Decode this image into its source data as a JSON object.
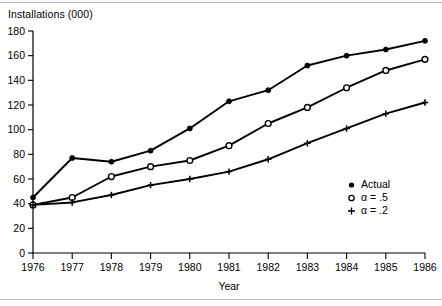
{
  "figure": {
    "y_axis_title": "Installations (000)",
    "x_axis_title": "Year"
  },
  "legend": {
    "position": "right-inside",
    "entries": [
      {
        "marker": "filled-circle-icon",
        "label": "Actual"
      },
      {
        "marker": "open-circle-icon",
        "label": "α = .5"
      },
      {
        "marker": "plus-icon",
        "label": "α = .2"
      }
    ]
  },
  "axes": {
    "y_ticks": [
      "180",
      "160",
      "140",
      "120",
      "100",
      "80",
      "60",
      "40",
      "20",
      "0"
    ],
    "x_ticks": [
      "1976",
      "1977",
      "1978",
      "1979",
      "1980",
      "1981",
      "1982",
      "1983",
      "1984",
      "1985",
      "1986"
    ]
  },
  "chart_data": {
    "type": "line",
    "title": "",
    "xlabel": "Year",
    "ylabel": "Installations (000)",
    "x": [
      1976,
      1977,
      1978,
      1979,
      1980,
      1981,
      1982,
      1983,
      1984,
      1985,
      1986
    ],
    "categories": [
      "1976",
      "1977",
      "1978",
      "1979",
      "1980",
      "1981",
      "1982",
      "1983",
      "1984",
      "1985",
      "1986"
    ],
    "xlim": [
      1976,
      1986
    ],
    "ylim": [
      0,
      180
    ],
    "ytick_step": 20,
    "grid": false,
    "legend_position": "right-inside",
    "series": [
      {
        "name": "Actual",
        "marker": "filled-circle",
        "values": [
          45,
          77,
          74,
          83,
          101,
          123,
          132,
          152,
          160,
          165,
          172
        ]
      },
      {
        "name": "α = .5",
        "marker": "open-circle",
        "values": [
          39,
          45,
          62,
          70,
          75,
          87,
          105,
          118,
          134,
          148,
          157
        ]
      },
      {
        "name": "α = .2",
        "marker": "plus",
        "values": [
          39,
          41,
          47,
          55,
          60,
          66,
          76,
          89,
          101,
          113,
          122
        ]
      }
    ]
  }
}
